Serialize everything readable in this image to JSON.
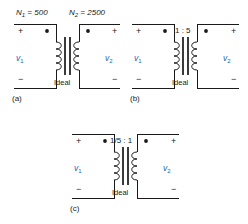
{
  "figure": {
    "type": "circuit-diagram-set",
    "accent_color": "#2a63b8",
    "line_color": "#1a1a1a"
  },
  "panels": [
    {
      "id": "a",
      "caption": "(a)",
      "primary_turns_label": "N",
      "primary_turns_sub": "1",
      "primary_turns_eq": " = 500",
      "secondary_turns_label": "N",
      "secondary_turns_sub": "2",
      "secondary_turns_eq": " = 2500",
      "ratio_label": "",
      "ideal_label": "Ideal",
      "primary_plus": "+",
      "primary_minus": "−",
      "secondary_plus": "+",
      "secondary_minus": "−",
      "primary_voltage": "v",
      "primary_voltage_sub": "1",
      "secondary_voltage": "v",
      "secondary_voltage_sub": "2"
    },
    {
      "id": "b",
      "caption": "(b)",
      "primary_turns_label": "",
      "primary_turns_sub": "",
      "primary_turns_eq": "",
      "secondary_turns_label": "",
      "secondary_turns_sub": "",
      "secondary_turns_eq": "",
      "ratio_label": "1 : 5",
      "ideal_label": "Ideal",
      "primary_plus": "+",
      "primary_minus": "−",
      "secondary_plus": "+",
      "secondary_minus": "−",
      "primary_voltage": "v",
      "primary_voltage_sub": "1",
      "secondary_voltage": "v",
      "secondary_voltage_sub": "2"
    },
    {
      "id": "c",
      "caption": "(c)",
      "primary_turns_label": "",
      "primary_turns_sub": "",
      "primary_turns_eq": "",
      "secondary_turns_label": "",
      "secondary_turns_sub": "",
      "secondary_turns_eq": "",
      "ratio_label": "1/5 : 1",
      "ideal_label": "Ideal",
      "primary_plus": "+",
      "primary_minus": "−",
      "secondary_plus": "+",
      "secondary_minus": "−",
      "primary_voltage": "v",
      "primary_voltage_sub": "1",
      "secondary_voltage": "v",
      "secondary_voltage_sub": "2"
    }
  ]
}
